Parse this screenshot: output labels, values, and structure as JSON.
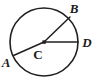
{
  "figure": {
    "type": "circle-with-radii",
    "stroke_color": "#231f20",
    "fill_color": "#ffffff",
    "background_color": "#ffffff",
    "circle": {
      "center_x": 44,
      "center_y": 42,
      "radius": 34,
      "stroke_width": 1.6
    },
    "center_point": {
      "label": "C",
      "x": 44,
      "y": 42,
      "dot_size": 3.2,
      "label_x": 38,
      "label_y": 58
    },
    "points": [
      {
        "name": "A",
        "label": "A",
        "x": 13.5,
        "y": 55.5,
        "label_x": 1,
        "label_y": 67
      },
      {
        "name": "B",
        "label": "B",
        "x": 70,
        "y": 17,
        "label_x": 70,
        "label_y": 13
      },
      {
        "name": "D",
        "label": "D",
        "x": 78,
        "y": 42,
        "label_x": 82,
        "label_y": 47
      }
    ],
    "radii": [
      {
        "name": "radius-CA",
        "from": "C",
        "to": "A",
        "stroke_width": 1.5
      },
      {
        "name": "radius-CB",
        "from": "C",
        "to": "B",
        "stroke_width": 1.5
      },
      {
        "name": "radius-CD",
        "from": "C",
        "to": "D",
        "stroke_width": 1.5
      }
    ]
  }
}
